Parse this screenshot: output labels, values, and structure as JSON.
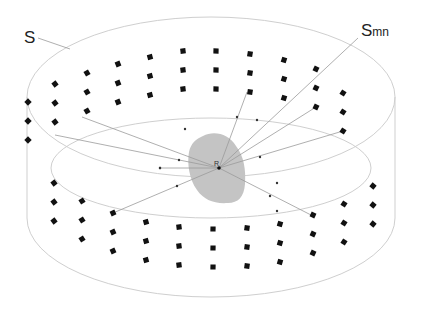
{
  "figure": {
    "type": "cylindrical microphone/speaker array diagram",
    "labels": {
      "surface": "S",
      "element_main": "S",
      "element_sub": "mn",
      "receiver": "R"
    },
    "colors": {
      "background": "#ffffff",
      "outline": "#c8c8c8",
      "ray": "#9a9a9a",
      "marker": "#111111",
      "blob": "#c4c4c4",
      "text": "#222222"
    },
    "cylinder": {
      "top_ellipse": {
        "cx": 211,
        "cy": 97,
        "rx": 184,
        "ry": 80
      },
      "bottom_front_y": 297,
      "side_top_y": 97,
      "side_bottom_y": 218
    },
    "inner_ellipse": {
      "cx": 211,
      "cy": 168,
      "rx": 160,
      "ry": 50
    },
    "receiver": {
      "x": 219,
      "y": 168
    },
    "upper_markers": [
      [
        28,
        102
      ],
      [
        28,
        121
      ],
      [
        28,
        140
      ],
      [
        55,
        84
      ],
      [
        55,
        103
      ],
      [
        55,
        122
      ],
      [
        87,
        73
      ],
      [
        87,
        92
      ],
      [
        87,
        111
      ],
      [
        118,
        64
      ],
      [
        118,
        83
      ],
      [
        118,
        102
      ],
      [
        150,
        57
      ],
      [
        150,
        76
      ],
      [
        150,
        95
      ],
      [
        183,
        51
      ],
      [
        183,
        70
      ],
      [
        183,
        89
      ],
      [
        216,
        51
      ],
      [
        216,
        70
      ],
      [
        216,
        89
      ],
      [
        250,
        54
      ],
      [
        250,
        73
      ],
      [
        250,
        92
      ],
      [
        284,
        60
      ],
      [
        284,
        79
      ],
      [
        284,
        98
      ],
      [
        316,
        69
      ],
      [
        316,
        88
      ],
      [
        316,
        107
      ],
      [
        343,
        93
      ],
      [
        343,
        112
      ],
      [
        343,
        131
      ]
    ],
    "lower_markers": [
      [
        54,
        183
      ],
      [
        54,
        202
      ],
      [
        54,
        221
      ],
      [
        82,
        201
      ],
      [
        82,
        220
      ],
      [
        82,
        239
      ],
      [
        113,
        213
      ],
      [
        113,
        232
      ],
      [
        113,
        251
      ],
      [
        146,
        222
      ],
      [
        146,
        241
      ],
      [
        146,
        260
      ],
      [
        179,
        227
      ],
      [
        179,
        246
      ],
      [
        179,
        265
      ],
      [
        213,
        229
      ],
      [
        213,
        248
      ],
      [
        213,
        267
      ],
      [
        247,
        228
      ],
      [
        247,
        247
      ],
      [
        247,
        266
      ],
      [
        280,
        224
      ],
      [
        280,
        243
      ],
      [
        280,
        262
      ],
      [
        313,
        215
      ],
      [
        313,
        234
      ],
      [
        313,
        253
      ],
      [
        344,
        204
      ],
      [
        344,
        223
      ],
      [
        344,
        242
      ],
      [
        373,
        186
      ],
      [
        373,
        205
      ],
      [
        373,
        224
      ]
    ],
    "rays": [
      {
        "to": [
          82,
          117
        ],
        "dot": [
          185,
          129
        ]
      },
      {
        "to": [
          55,
          135
        ],
        "dot": [
          179,
          160
        ]
      },
      {
        "to": [
          343,
          131
        ],
        "dot": [
          260,
          157
        ]
      },
      {
        "to": [
          316,
          107
        ],
        "dot": [
          257,
          120
        ]
      },
      {
        "to": [
          113,
          213
        ],
        "dot": [
          177,
          186
        ]
      },
      {
        "to": [
          311,
          215
        ],
        "dot": [
          270,
          196
        ]
      },
      {
        "to": [
          247,
          92
        ],
        "dot": [
          237,
          117
        ]
      },
      {
        "to": [
          358,
          38
        ],
        "dot": null
      },
      {
        "to": [
          160,
          168
        ],
        "dot": [
          160,
          168
        ]
      }
    ],
    "ray_dots_extra": [
      [
        160,
        168
      ],
      [
        277,
        211
      ],
      [
        277,
        183
      ]
    ]
  }
}
